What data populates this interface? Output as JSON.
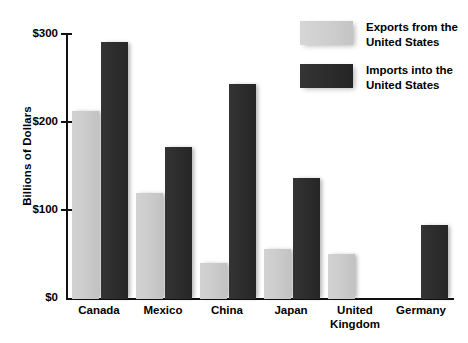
{
  "chart_data": {
    "type": "bar",
    "title": "",
    "xlabel": "",
    "ylabel": "Billions of Dollars",
    "ylim": [
      0,
      300
    ],
    "ytick_labels": [
      "$0",
      "$100",
      "$200",
      "$300"
    ],
    "ytick_values": [
      0,
      100,
      200,
      300
    ],
    "grid": false,
    "legend_position": "top-right",
    "categories": [
      "Canada",
      "Mexico",
      "China",
      "Japan",
      "United\nKingdom",
      "Germany"
    ],
    "series": [
      {
        "name": "Exports from the\nUnited States",
        "color": "#cbcbcb",
        "values": [
          212,
          120,
          41,
          56,
          51,
          null
        ]
      },
      {
        "name": "Imports into the\nUnited States",
        "color": "#2c2c2c",
        "values": [
          290,
          171,
          243,
          137,
          null,
          83
        ]
      }
    ]
  },
  "legend": {
    "items": [
      {
        "label": "Exports from the\nUnited States",
        "swatch": "light-gray-swatch"
      },
      {
        "label": "Imports into the\nUnited States",
        "swatch": "dark-gray-swatch"
      }
    ]
  },
  "colors": {
    "exports": "#cbcbcb",
    "imports": "#2c2c2c",
    "axis": "#111111",
    "background": "#ffffff"
  }
}
